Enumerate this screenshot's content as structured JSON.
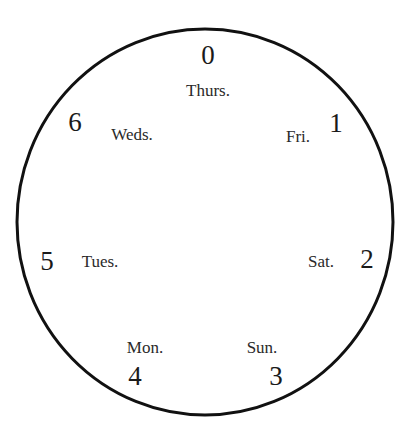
{
  "diagram": {
    "type": "circular day-of-week mapping",
    "stroke_color": "#111111",
    "positions": [
      {
        "number": "0",
        "day": "Thurs."
      },
      {
        "number": "1",
        "day": "Fri."
      },
      {
        "number": "2",
        "day": "Sat."
      },
      {
        "number": "3",
        "day": "Sun."
      },
      {
        "number": "4",
        "day": "Mon."
      },
      {
        "number": "5",
        "day": "Tues."
      },
      {
        "number": "6",
        "day": "Weds."
      }
    ]
  }
}
